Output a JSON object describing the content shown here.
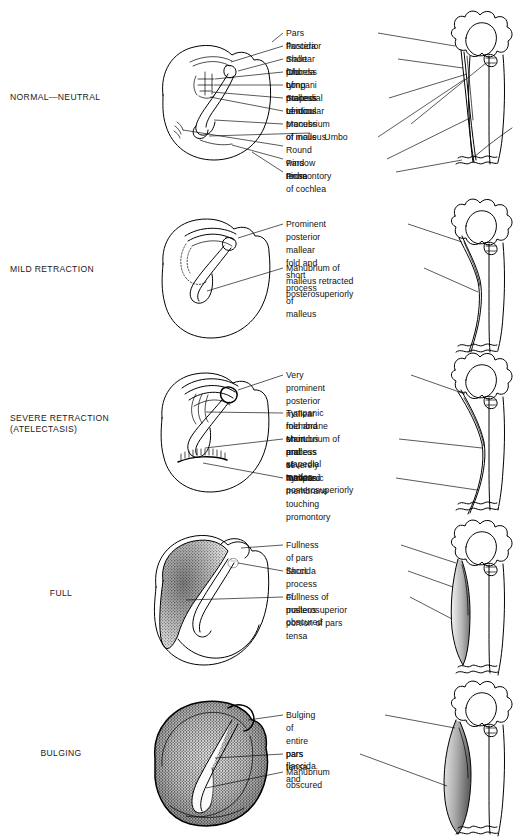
{
  "figure": {
    "background": "#ffffff",
    "ink": "#000000"
  },
  "rows": [
    {
      "id": "normal-neutral",
      "caption": "NORMAL—NEUTRAL",
      "caption_align": "left",
      "labels": [
        "Pars flaccida",
        "Posterior mallear fold",
        "Short process of malleus",
        "Chorda tympani",
        "Long process of incus",
        "Stapedial tendon",
        "Lenticular process of incus",
        "Manubrium of malleus",
        "Umbo",
        "Round window niche",
        "Pars tensa",
        "Promontory of cochlea"
      ]
    },
    {
      "id": "mild-retraction",
      "caption": "MILD RETRACTION",
      "caption_align": "left",
      "labels": [
        "Prominent posterior mallear\nfold and short process of\nmalleus",
        "Manubrium of malleus retracted\nposterosuperiorly"
      ]
    },
    {
      "id": "severe-retraction",
      "caption": "SEVERE RETRACTION\n(ATELECTASIS)",
      "caption_align": "left",
      "labels": [
        "Very prominent posterior\nmallear fold and short\nprocess of malleus",
        "Tympanic membrane on incus\nand stapedial tendon",
        "Manubrium of malleus\nseverely retracted\nposterosuperiorly",
        "Tympanic membrane\ntouching promontory"
      ]
    },
    {
      "id": "full",
      "caption": "FULL",
      "caption_align": "centered",
      "labels": [
        "Fullness of pars flaccida",
        "Short process of malleus\nobscured",
        "Fullness of posterosuperior\nportion of pars tensa"
      ]
    },
    {
      "id": "bulging",
      "caption": "BULGING",
      "caption_align": "centered",
      "labels": [
        "Bulging of entire\npars flaccida\nand",
        "pars tensa",
        "Manubrium obscured"
      ]
    }
  ]
}
